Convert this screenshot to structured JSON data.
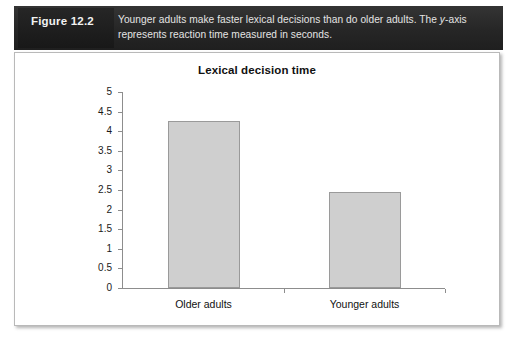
{
  "figure": {
    "number_label": "Figure 12.2",
    "caption_part1": "Younger adults make faster lexical decisions than do older adults. The ",
    "caption_italic": "y",
    "caption_part2": "-axis represents reaction time measured in seconds.",
    "caption_full": "Younger adults make faster lexical decisions than do older adults. The y-axis represents reaction time measured in seconds.",
    "banner_color": "#2b2b2b",
    "banner_text_color": "#e4e4e4"
  },
  "chart_data": {
    "type": "bar",
    "title": "Lexical decision time",
    "xlabel": "",
    "ylabel": "",
    "categories": [
      "Older adults",
      "Younger adults"
    ],
    "values": [
      4.26,
      2.45
    ],
    "ylim": [
      0,
      5
    ],
    "yticks": [
      "0",
      "0.5",
      "1",
      "1.5",
      "2",
      "2.5",
      "3",
      "3.5",
      "4",
      "4.5",
      "5"
    ],
    "ytick_values": [
      0,
      0.5,
      1,
      1.5,
      2,
      2.5,
      3,
      3.5,
      4,
      4.5,
      5
    ],
    "grid": false,
    "legend": false,
    "bar_fill": "#cfcfcf",
    "bar_border": "#9a9a9a",
    "axis_color": "#8d8d8d"
  }
}
